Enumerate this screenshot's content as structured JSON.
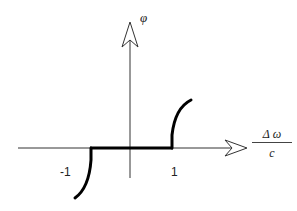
{
  "diagram": {
    "type": "nonlinear-characteristic",
    "y_axis_label": "φ",
    "x_axis_label": {
      "numerator": "Δ ω",
      "denominator": "c"
    },
    "x_ticks": [
      {
        "label": "-1",
        "value": -1
      },
      {
        "label": "1",
        "value": 1
      }
    ],
    "colors": {
      "axis": "#333333",
      "curve": "#000000",
      "background": "#ffffff"
    }
  }
}
